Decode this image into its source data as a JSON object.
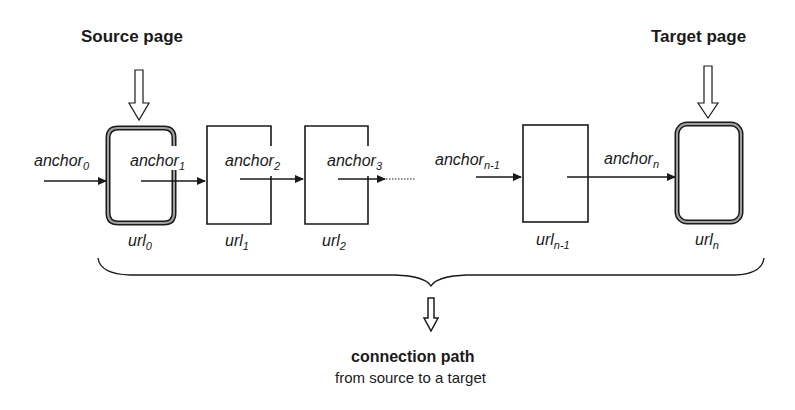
{
  "labels": {
    "source_page": "Source page",
    "target_page": "Target page",
    "connection_path": "connection path",
    "connection_subtitle": "from source to a target"
  },
  "anchors": [
    {
      "base": "anchor",
      "sub": "0"
    },
    {
      "base": "anchor",
      "sub": "1"
    },
    {
      "base": "anchor",
      "sub": "2"
    },
    {
      "base": "anchor",
      "sub": "3"
    },
    {
      "base": "anchor",
      "sub": "n-1"
    },
    {
      "base": "anchor",
      "sub": "n"
    }
  ],
  "urls": [
    {
      "base": "url",
      "sub": "0"
    },
    {
      "base": "url",
      "sub": "1"
    },
    {
      "base": "url",
      "sub": "2"
    },
    {
      "base": "url",
      "sub": "n-1"
    },
    {
      "base": "url",
      "sub": "n"
    }
  ],
  "colors": {
    "stroke": "#1a1a1a",
    "highlight_core": "#9a9a9a",
    "background": "#ffffff"
  }
}
